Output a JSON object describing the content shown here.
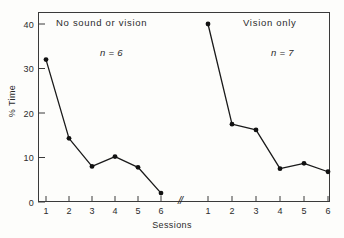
{
  "chart_data": {
    "type": "line",
    "title": "",
    "xlabel": "Sessions",
    "ylabel": "% Time",
    "ylim": [
      0,
      42
    ],
    "yticks": [
      0,
      10,
      20,
      30,
      40
    ],
    "ytick_labels": [
      "0",
      "10",
      "20",
      "30",
      "40"
    ],
    "grid": false,
    "legend": "none",
    "axis_break_label": "//",
    "panels": [
      {
        "name": "no-sound-or-vision",
        "title": "No sound or vision",
        "subject_count_label": "n = 6",
        "categories": [
          "1",
          "2",
          "3",
          "4",
          "5",
          "6"
        ],
        "values": [
          32.0,
          14.3,
          8.0,
          10.2,
          7.8,
          2.0
        ]
      },
      {
        "name": "vision-only",
        "title": "Vision only",
        "subject_count_label": "n = 7",
        "categories": [
          "1",
          "2",
          "3",
          "4",
          "5",
          "6"
        ],
        "values": [
          40.0,
          17.5,
          16.2,
          7.5,
          8.7,
          6.8
        ]
      }
    ],
    "colors": {
      "line": "#1a1a1a",
      "marker": "#111111",
      "axis": "#3a3a3a",
      "background": "#fdfdfb"
    }
  }
}
